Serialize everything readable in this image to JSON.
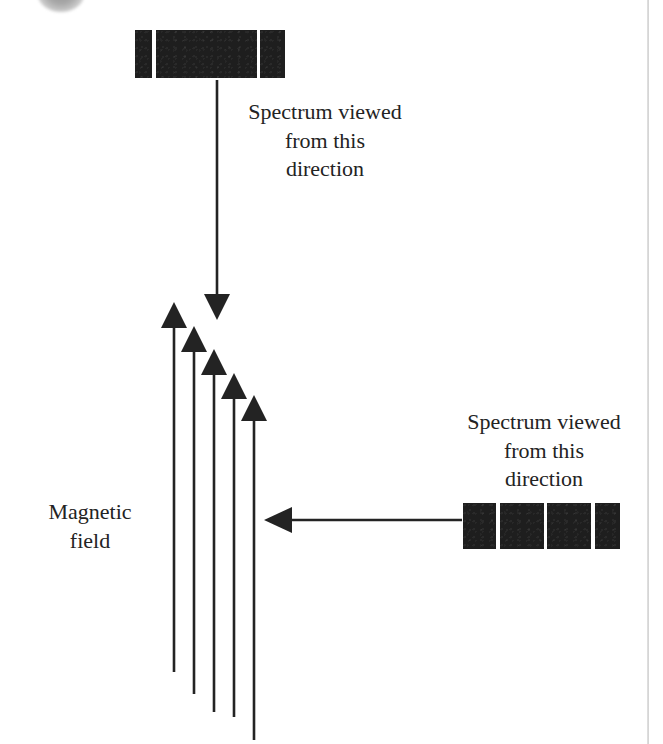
{
  "page": {
    "width": 663,
    "height": 744,
    "background_color": "#ffffff",
    "ink_color": "#232323",
    "bar_color": "#1e1e1e"
  },
  "artifacts": {
    "scan_blob_name": "scan-blob-top-left",
    "page_edge_line_name": "page-edge-line-right"
  },
  "captions": {
    "top": "Spectrum viewed\nfrom this\ndirection",
    "right": "Spectrum viewed\nfrom this\ndirection",
    "magnetic_field": "Magnetic\nfield"
  },
  "spectrum_top": {
    "label": "spectrum-bar-top",
    "segment_count": 3,
    "segments": [
      {
        "name": "line-1",
        "width": 17
      },
      {
        "name": "line-2",
        "width": 103
      },
      {
        "name": "line-3",
        "width": 25
      }
    ],
    "gaps": [
      4,
      3
    ],
    "x": 135,
    "y": 30,
    "width": 150,
    "height": 48
  },
  "spectrum_right": {
    "label": "spectrum-bar-right",
    "segment_count": 4,
    "segments": [
      {
        "name": "line-1",
        "width": 33
      },
      {
        "name": "line-2",
        "width": 44
      },
      {
        "name": "line-3",
        "width": 44
      },
      {
        "name": "line-4",
        "width": 25
      }
    ],
    "gaps": [
      4,
      3,
      4
    ],
    "x": 463,
    "y": 503,
    "width": 157,
    "height": 46
  },
  "arrows": {
    "view_down": {
      "name": "viewing-direction-arrow-down",
      "x1": 217,
      "y1": 80,
      "x2": 217,
      "y2": 320,
      "direction": "down"
    },
    "view_left": {
      "name": "viewing-direction-arrow-left",
      "x1": 462,
      "y1": 520,
      "x2": 264,
      "y2": 520,
      "direction": "left"
    },
    "field_lines": [
      {
        "name": "magnetic-field-arrow-1",
        "x": 174,
        "tip_y": 302,
        "tail_y": 672
      },
      {
        "name": "magnetic-field-arrow-2",
        "x": 194,
        "tip_y": 326,
        "tail_y": 694
      },
      {
        "name": "magnetic-field-arrow-3",
        "x": 214,
        "tip_y": 349,
        "tail_y": 712
      },
      {
        "name": "magnetic-field-arrow-4",
        "x": 234,
        "tip_y": 373,
        "tail_y": 717
      },
      {
        "name": "magnetic-field-arrow-5",
        "x": 254,
        "tip_y": 395,
        "tail_y": 740
      }
    ]
  }
}
